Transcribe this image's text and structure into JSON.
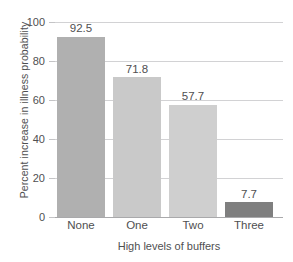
{
  "chart_data": {
    "type": "bar",
    "title": "",
    "xlabel": "High levels of buffers",
    "ylabel": "Percent increase in illness probability",
    "categories": [
      "None",
      "One",
      "Two",
      "Three"
    ],
    "values": [
      92.5,
      71.8,
      57.7,
      7.7
    ],
    "value_labels": [
      "92.5",
      "71.8",
      "57.7",
      "7.7"
    ],
    "bar_colors": [
      "#b0b0b0",
      "#c9c9c9",
      "#cfcfcf",
      "#7f7f7f"
    ],
    "ylim": [
      0,
      100
    ],
    "yticks": [
      0,
      20,
      40,
      60,
      80,
      100
    ],
    "ytick_labels": [
      "0",
      "20",
      "40",
      "60",
      "80",
      "100"
    ],
    "grid": true,
    "legend": "none",
    "gridline_color": "#d2d2d4",
    "axis_color": "#a9a9ab",
    "text_color": "#4f4f51",
    "background": "#ffffff"
  }
}
